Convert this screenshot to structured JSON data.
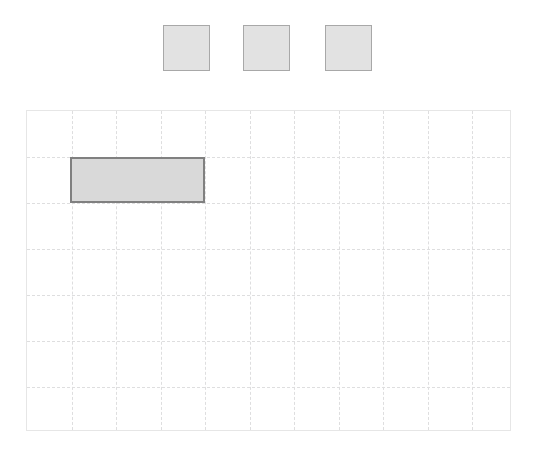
{
  "canvas": {
    "width": 537,
    "height": 459,
    "background": "#ffffff"
  },
  "tray": {
    "label": "piece-tray",
    "square_count": 3,
    "square_fill": "#e2e2e2",
    "square_border": "#a8a8a8",
    "squares": [
      {
        "name": "tray-square-1",
        "x": 163,
        "y": 25,
        "width": 47,
        "height": 46
      },
      {
        "name": "tray-square-2",
        "x": 243,
        "y": 25,
        "width": 47,
        "height": 46
      },
      {
        "name": "tray-square-3",
        "x": 325,
        "y": 25,
        "width": 47,
        "height": 46
      }
    ]
  },
  "board": {
    "label": "grid-board",
    "x": 26,
    "y": 110,
    "width": 485,
    "height": 321,
    "columns": 11,
    "rows": 7,
    "cell_width": 44.5,
    "cell_height": 46,
    "border_color": "#e6e6e6",
    "gridline_color": "#dededf",
    "gridline_style": "dashed",
    "background": "#ffffff",
    "vertical_gridlines": [
      44.5,
      89,
      133.5,
      178,
      222.5,
      267,
      311.5,
      356,
      400.5,
      445
    ],
    "horizontal_gridlines": [
      46,
      92,
      138,
      184,
      230,
      276
    ]
  },
  "placed_blocks": [
    {
      "name": "placed-block-1",
      "x": 70,
      "y": 157,
      "width": 135,
      "height": 46,
      "grid_col": 1,
      "grid_row": 1,
      "span_cols": 3,
      "span_rows": 1,
      "fill": "#d9d9d9",
      "border": "#808080"
    }
  ],
  "chart_data": {
    "type": "table",
    "title": "",
    "xlabel": "",
    "ylabel": "",
    "categories": [],
    "values": []
  }
}
